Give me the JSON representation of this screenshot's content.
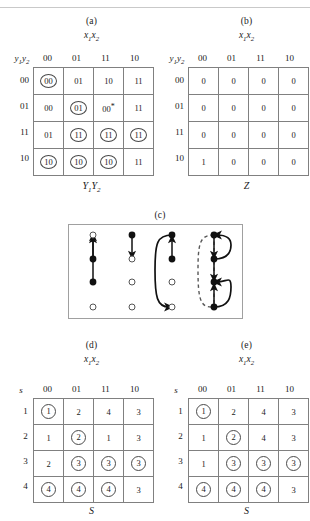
{
  "figure": {
    "panels": [
      {
        "id": "a",
        "caption": "(a)",
        "top_label": "x1x2",
        "bottom_label": "Y1Y2",
        "row_label": "y1y2"
      },
      {
        "id": "b",
        "caption": "(b)",
        "top_label": "x1x2",
        "bottom_label": "Z",
        "row_label": "y1y2"
      },
      {
        "id": "c",
        "caption": "(c)"
      },
      {
        "id": "d",
        "caption": "(d)",
        "top_label": "x1x2",
        "bottom_label": "S",
        "row_label": "s"
      },
      {
        "id": "e",
        "caption": "(e)",
        "top_label": "x1x2",
        "bottom_label": "S",
        "row_label": "s"
      }
    ]
  },
  "column_headers": [
    "00",
    "01",
    "11",
    "10"
  ],
  "table_a": {
    "row_headers": [
      "00",
      "01",
      "11",
      "10"
    ],
    "rows": [
      [
        {
          "v": "00",
          "circled": true,
          "star": false
        },
        {
          "v": "01",
          "circled": false,
          "star": false
        },
        {
          "v": "10",
          "circled": false,
          "star": false
        },
        {
          "v": "11",
          "circled": false,
          "star": false
        }
      ],
      [
        {
          "v": "00",
          "circled": false,
          "star": false
        },
        {
          "v": "01",
          "circled": true,
          "star": false
        },
        {
          "v": "00",
          "circled": false,
          "star": true
        },
        {
          "v": "11",
          "circled": false,
          "star": false
        }
      ],
      [
        {
          "v": "01",
          "circled": false,
          "star": false
        },
        {
          "v": "11",
          "circled": true,
          "star": false
        },
        {
          "v": "11",
          "circled": true,
          "star": false
        },
        {
          "v": "11",
          "circled": true,
          "star": false
        }
      ],
      [
        {
          "v": "10",
          "circled": true,
          "star": false
        },
        {
          "v": "10",
          "circled": true,
          "star": false
        },
        {
          "v": "10",
          "circled": true,
          "star": false
        },
        {
          "v": "11",
          "circled": false,
          "star": false
        }
      ]
    ]
  },
  "table_b": {
    "row_headers": [
      "00",
      "01",
      "11",
      "10"
    ],
    "rows": [
      [
        {
          "v": "0",
          "circled": false
        },
        {
          "v": "0",
          "circled": false
        },
        {
          "v": "0",
          "circled": false
        },
        {
          "v": "0",
          "circled": false
        }
      ],
      [
        {
          "v": "0",
          "circled": false
        },
        {
          "v": "0",
          "circled": false
        },
        {
          "v": "0",
          "circled": false
        },
        {
          "v": "0",
          "circled": false
        }
      ],
      [
        {
          "v": "0",
          "circled": false
        },
        {
          "v": "0",
          "circled": false
        },
        {
          "v": "0",
          "circled": false
        },
        {
          "v": "0",
          "circled": false
        }
      ],
      [
        {
          "v": "1",
          "circled": false
        },
        {
          "v": "0",
          "circled": false
        },
        {
          "v": "0",
          "circled": false
        },
        {
          "v": "0",
          "circled": false
        }
      ]
    ]
  },
  "table_d": {
    "row_headers": [
      "1",
      "2",
      "3",
      "4"
    ],
    "rows": [
      [
        {
          "v": "1",
          "circled": true
        },
        {
          "v": "2",
          "circled": false
        },
        {
          "v": "4",
          "circled": false
        },
        {
          "v": "3",
          "circled": false
        }
      ],
      [
        {
          "v": "1",
          "circled": false
        },
        {
          "v": "2",
          "circled": true
        },
        {
          "v": "1",
          "circled": false
        },
        {
          "v": "3",
          "circled": false
        }
      ],
      [
        {
          "v": "2",
          "circled": false
        },
        {
          "v": "3",
          "circled": true
        },
        {
          "v": "3",
          "circled": true
        },
        {
          "v": "3",
          "circled": true
        }
      ],
      [
        {
          "v": "4",
          "circled": true
        },
        {
          "v": "4",
          "circled": true
        },
        {
          "v": "4",
          "circled": true
        },
        {
          "v": "3",
          "circled": false
        }
      ]
    ]
  },
  "table_e": {
    "row_headers": [
      "1",
      "2",
      "3",
      "4"
    ],
    "rows": [
      [
        {
          "v": "1",
          "circled": true
        },
        {
          "v": "2",
          "circled": false
        },
        {
          "v": "4",
          "circled": false
        },
        {
          "v": "3",
          "circled": false
        }
      ],
      [
        {
          "v": "1",
          "circled": false
        },
        {
          "v": "2",
          "circled": true
        },
        {
          "v": "4",
          "circled": false
        },
        {
          "v": "3",
          "circled": false
        }
      ],
      [
        {
          "v": "1",
          "circled": false
        },
        {
          "v": "3",
          "circled": true
        },
        {
          "v": "3",
          "circled": true
        },
        {
          "v": "3",
          "circled": true
        }
      ],
      [
        {
          "v": "4",
          "circled": true
        },
        {
          "v": "4",
          "circled": true
        },
        {
          "v": "4",
          "circled": true
        },
        {
          "v": "3",
          "circled": false
        }
      ]
    ]
  },
  "panel_c": {
    "columns": [
      {
        "nodes": [
          "open",
          "filled",
          "filled",
          "open"
        ]
      },
      {
        "nodes": [
          "filled",
          "open",
          "open",
          "open"
        ]
      },
      {
        "nodes": [
          "filled",
          "filled",
          "open",
          "open"
        ]
      },
      {
        "nodes": [
          "filled",
          "filled",
          "filled",
          "filled"
        ]
      }
    ]
  },
  "colors": {
    "grid_line": "#808080",
    "panel_border": "#a0a0a0",
    "ink": "#1a1a1a",
    "circle_stroke": "#4a4a4a"
  }
}
